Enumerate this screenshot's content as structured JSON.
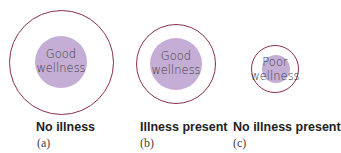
{
  "panels": [
    {
      "inner_text_1": "Good",
      "inner_text_2": "wellness",
      "label": "No illness",
      "sub": "(a)"
    },
    {
      "inner_text_1": "Good",
      "inner_text_2": "wellness",
      "label": "Illness present",
      "sub": "(b)"
    },
    {
      "inner_text_1": "Poor",
      "inner_text_2": "wellness",
      "label": "No illness present",
      "sub": "(c)"
    }
  ],
  "colors": {
    "ring": "#8a2f4a",
    "fill": "#c5aed6"
  }
}
